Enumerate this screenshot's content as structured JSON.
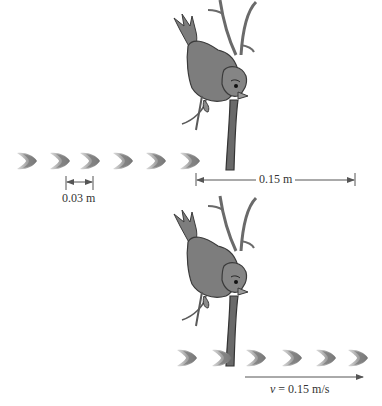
{
  "panels": [
    {
      "id": "top",
      "description": "Bird on branch watching a row of bugs spaced 0.03 m apart",
      "bug_count": 6,
      "spacing_label": "0.03 m",
      "distance_label": "0.15 m"
    },
    {
      "id": "bottom",
      "description": "Bird on branch as bug row moves to the right",
      "bug_count": 6,
      "velocity_label": "v = 0.15 m/s",
      "velocity_symbol": "v",
      "velocity_value": "= 0.15 m/s"
    }
  ],
  "colors": {
    "bird": "#7a7a7a",
    "bird_outline": "#3a3a3a",
    "branch": "#6a6a6a",
    "bug_light": "#c8c8c8",
    "bug_dark": "#7d7d7d",
    "arrow": "#555555"
  }
}
